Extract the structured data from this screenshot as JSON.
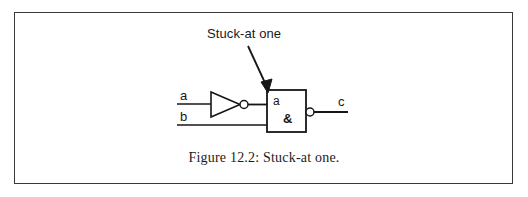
{
  "figure": {
    "caption": "Figure 12.2: Stuck-at one.",
    "annotation": {
      "text": "Stuck-at one",
      "arrow": "diagonal-arrow-down-right"
    },
    "border_color": "#3a3a3a",
    "line_color": "#161616",
    "background": "#ffffff"
  },
  "circuit": {
    "inputs": [
      {
        "label": "a",
        "wire": "input-wire-a"
      },
      {
        "label": "b",
        "wire": "input-wire-b"
      }
    ],
    "outputs": [
      {
        "label": "c",
        "wire": "output-wire-c"
      }
    ],
    "components": [
      {
        "type": "inverter",
        "name": "not-gate",
        "symbol": "triangle-with-bubble",
        "inverting_bubble": true
      },
      {
        "type": "nand-gate",
        "name": "and-gate-box",
        "symbol": "rectangle-iec",
        "input_label": "a",
        "operator_label": "&",
        "inverting_bubble": true
      }
    ]
  }
}
